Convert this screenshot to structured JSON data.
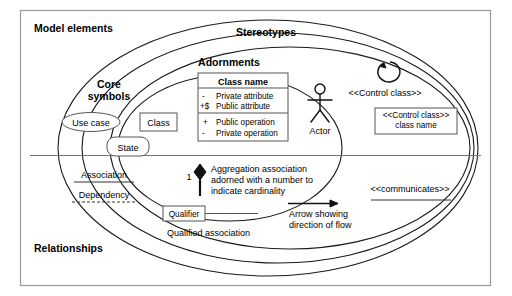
{
  "diagram": {
    "regions": {
      "model_elements": "Model elements",
      "stereotypes": "Stereotypes",
      "adornments": "Adornments",
      "core_symbols_line1": "Core",
      "core_symbols_line2": "symbols",
      "relationships": "Relationships"
    },
    "core_symbols": {
      "use_case": "Use case",
      "state": "State",
      "class": "Class"
    },
    "class_box": {
      "name": "Class name",
      "attributes": [
        {
          "visibility": "-",
          "text": "Private attribute"
        },
        {
          "visibility": "+$",
          "text": "Public attribute"
        }
      ],
      "operations": [
        {
          "visibility": "+",
          "text": "Public operation"
        },
        {
          "visibility": "-",
          "text": "Private operation"
        }
      ]
    },
    "actor": {
      "label": "Actor",
      "icon": "stick-figure-icon"
    },
    "control_class": {
      "icon": "circular-arrow-icon",
      "stereotype_label": "<<Control class>>",
      "box_line1": "<<Control class>>",
      "box_line2": "class name"
    },
    "relationships": {
      "association": "Association",
      "dependency": "Dependency",
      "communicates": "<<communicates>>",
      "aggregation": {
        "cardinality": "1",
        "line1": "Aggregation association",
        "line2": "adorned with a number to",
        "line3": "indicate cardinality"
      },
      "qualifier": {
        "box_label": "Qualifier",
        "caption": "Qualified association"
      },
      "arrow": {
        "line1": "Arrow showing",
        "line2": "direction of flow"
      }
    },
    "colors": {
      "ink": "#111111",
      "frame": "#9a9a9a",
      "box_stroke": "#555555",
      "background": "#ffffff"
    }
  }
}
